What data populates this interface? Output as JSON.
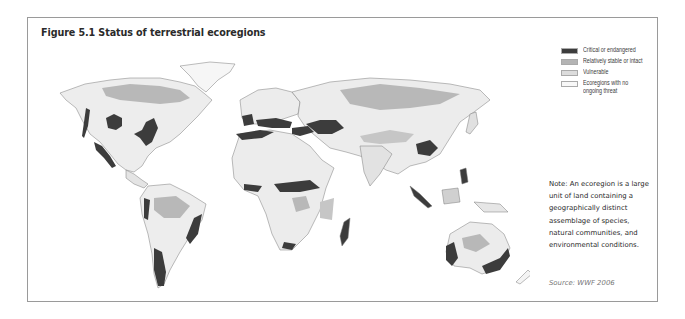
{
  "figure": {
    "title": "Figure 5.1 Status of terrestrial ecoregions"
  },
  "legend": {
    "items": [
      {
        "label": "Critical or endangered",
        "color": "#3c3c3c"
      },
      {
        "label": "Relatively stable or intact",
        "color": "#b4b4b4"
      },
      {
        "label": "Vulnerable",
        "color": "#dcdcdc"
      },
      {
        "label": "Ecoregions with no ongoing threat",
        "label_line1": "Ecoregions with no",
        "label_line2": "ongoing threat",
        "color": "#f8f8f8"
      }
    ]
  },
  "note": {
    "text": "Note: An ecoregion is a large unit of land containing a geographically distinct assemblage of species, natural communities, and environmental conditions."
  },
  "source": {
    "text": "Source: WWF 2006"
  },
  "colors": {
    "critical": "#3c3c3c",
    "stable": "#b4b4b4",
    "vulnerable": "#dcdcdc",
    "no_threat": "#f8f8f8",
    "border": "#7a7a7a",
    "ocean": "#ffffff"
  }
}
